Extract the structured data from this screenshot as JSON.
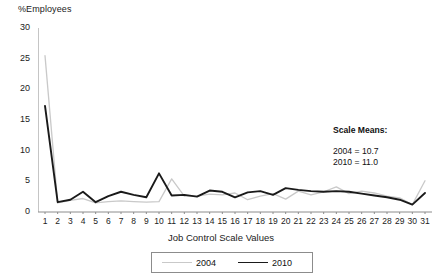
{
  "chart_data": {
    "type": "line",
    "title": "",
    "xlabel": "Job Control Scale Values",
    "ylabel": "%Employees",
    "xlim": [
      1,
      31
    ],
    "ylim": [
      0,
      30
    ],
    "yticks": [
      0,
      5,
      10,
      15,
      20,
      25,
      30
    ],
    "grid": false,
    "legend_position": "bottom-center",
    "x": [
      1,
      2,
      3,
      4,
      5,
      6,
      7,
      8,
      9,
      10,
      11,
      12,
      13,
      14,
      15,
      16,
      17,
      18,
      19,
      20,
      21,
      22,
      23,
      24,
      25,
      26,
      27,
      28,
      29,
      30,
      31
    ],
    "series": [
      {
        "name": "2004",
        "color": "#c9c9c9",
        "values": [
          25.5,
          1.5,
          1.9,
          2.2,
          1.5,
          1.7,
          1.8,
          1.7,
          1.6,
          1.7,
          5.4,
          2.6,
          2.6,
          2.9,
          2.8,
          3.1,
          2.0,
          2.6,
          3.0,
          2.1,
          3.4,
          2.8,
          3.3,
          4.1,
          3.0,
          3.4,
          3.1,
          2.6,
          2.3,
          1.2,
          5.1
        ]
      },
      {
        "name": "2010",
        "color": "#1a1a1a",
        "values": [
          17.3,
          1.6,
          2.0,
          3.3,
          1.6,
          2.6,
          3.3,
          2.8,
          2.4,
          6.3,
          2.7,
          2.8,
          2.5,
          3.5,
          3.3,
          2.4,
          3.2,
          3.4,
          2.8,
          3.9,
          3.6,
          3.4,
          3.3,
          3.4,
          3.3,
          3.0,
          2.7,
          2.4,
          2.0,
          1.2,
          3.1
        ]
      }
    ],
    "annotations": {
      "heading": "Scale Means:",
      "line1": "2004 = 10.7",
      "line2": "2010 = 11.0"
    }
  }
}
